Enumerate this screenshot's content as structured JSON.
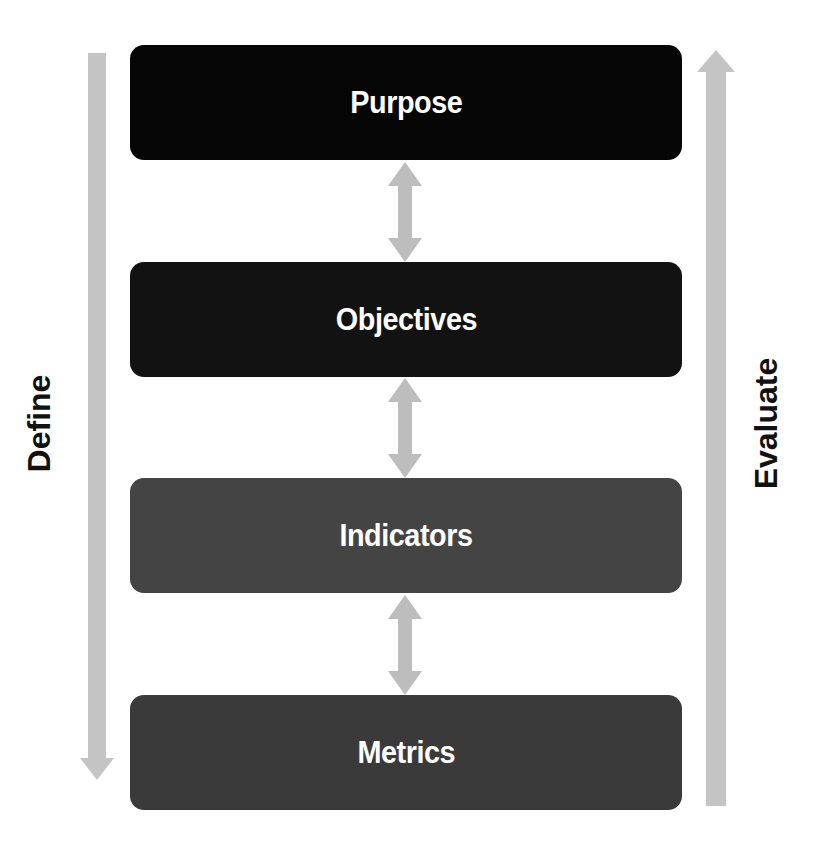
{
  "diagram": {
    "boxes": [
      {
        "label": "Purpose",
        "color": "#050505"
      },
      {
        "label": "Objectives",
        "color": "#121212"
      },
      {
        "label": "Indicators",
        "color": "#444444"
      },
      {
        "label": "Metrics",
        "color": "#3a3a3a"
      }
    ],
    "left_arrow": {
      "label": "Define",
      "direction": "down",
      "color": "#c4c4c4"
    },
    "right_arrow": {
      "label": "Evaluate",
      "direction": "up",
      "color": "#c4c4c4"
    },
    "connector_arrows": {
      "type": "bidirectional",
      "count": 3,
      "color": "#bdbdbd"
    }
  }
}
